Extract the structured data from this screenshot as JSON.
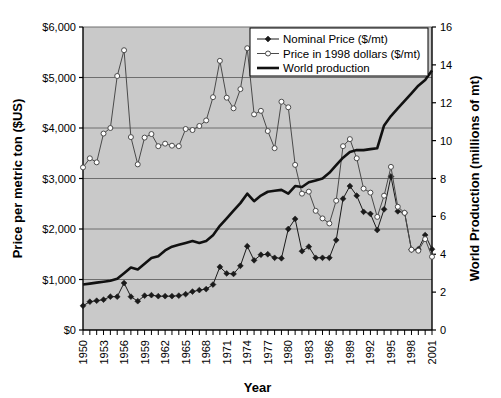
{
  "chart_data": {
    "type": "line",
    "title": "",
    "xlabel": "Year",
    "ylabel": "Price per metric ton ($US)",
    "y2label": "World Production (millions of mt)",
    "grid": true,
    "legend_position": "top-right",
    "plot_background": "#c9c9c9",
    "xlim": [
      1950,
      2001
    ],
    "ylim": [
      0,
      6000
    ],
    "y2lim": [
      0,
      16
    ],
    "ytick_labels": [
      "$0",
      "$1,000",
      "$2,000",
      "$3,000",
      "$4,000",
      "$5,000",
      "$6,000"
    ],
    "ytick_values": [
      0,
      1000,
      2000,
      3000,
      4000,
      5000,
      6000
    ],
    "y2tick_labels": [
      "0",
      "2",
      "4",
      "6",
      "8",
      "10",
      "12",
      "14",
      "16"
    ],
    "y2tick_values": [
      0,
      2,
      4,
      6,
      8,
      10,
      12,
      14,
      16
    ],
    "xtick_labels": [
      "1950",
      "1953",
      "1956",
      "1959",
      "1962",
      "1965",
      "1968",
      "1971",
      "1974",
      "1977",
      "1980",
      "1983",
      "1986",
      "1989",
      "1992",
      "1995",
      "1998",
      "2001"
    ],
    "xtick_values": [
      1950,
      1953,
      1956,
      1959,
      1962,
      1965,
      1968,
      1971,
      1974,
      1977,
      1980,
      1983,
      1986,
      1989,
      1992,
      1995,
      1998,
      2001
    ],
    "x": [
      1950,
      1951,
      1952,
      1953,
      1954,
      1955,
      1956,
      1957,
      1958,
      1959,
      1960,
      1961,
      1962,
      1963,
      1964,
      1965,
      1966,
      1967,
      1968,
      1969,
      1970,
      1971,
      1972,
      1973,
      1974,
      1975,
      1976,
      1977,
      1978,
      1979,
      1980,
      1981,
      1982,
      1983,
      1984,
      1985,
      1986,
      1987,
      1988,
      1989,
      1990,
      1991,
      1992,
      1993,
      1994,
      1995,
      1996,
      1997,
      1998,
      1999,
      2000,
      2001
    ],
    "series": [
      {
        "name": "Nominal Price ($/mt)",
        "axis": "left",
        "color": "#1a1a1a",
        "marker": "filled-diamond",
        "values": [
          480,
          560,
          580,
          600,
          660,
          660,
          930,
          660,
          570,
          680,
          690,
          670,
          670,
          670,
          680,
          710,
          760,
          790,
          810,
          900,
          1250,
          1120,
          1110,
          1270,
          1660,
          1380,
          1490,
          1500,
          1430,
          1420,
          2000,
          2200,
          1560,
          1650,
          1430,
          1430,
          1430,
          1780,
          2600,
          2850,
          2660,
          2340,
          2300,
          1980,
          2390,
          3040,
          2350,
          2320,
          1590,
          1600,
          1880,
          1600
        ]
      },
      {
        "name": "Price in 1998 dollars ($/mt)",
        "axis": "left",
        "color": "#4a4a4a",
        "marker": "open-circle",
        "values": [
          3220,
          3400,
          3320,
          3890,
          4000,
          5030,
          5540,
          3820,
          3280,
          3810,
          3880,
          3640,
          3690,
          3650,
          3640,
          3980,
          3960,
          4040,
          4150,
          4610,
          5330,
          4600,
          4390,
          4770,
          5580,
          4270,
          4340,
          3940,
          3600,
          4520,
          4410,
          3270,
          2700,
          2740,
          2360,
          2210,
          2110,
          2560,
          3640,
          3780,
          3400,
          2800,
          2720,
          2240,
          2660,
          3230,
          2440,
          2320,
          1590,
          1570,
          1800,
          1450
        ]
      },
      {
        "name": "World production",
        "axis": "right",
        "color": "#111111",
        "marker": "none",
        "values": [
          2.4,
          2.45,
          2.5,
          2.55,
          2.6,
          2.7,
          3.0,
          3.3,
          3.2,
          3.5,
          3.8,
          3.9,
          4.2,
          4.4,
          4.5,
          4.6,
          4.7,
          4.6,
          4.7,
          5.0,
          5.5,
          5.9,
          6.3,
          6.7,
          7.2,
          6.8,
          7.1,
          7.3,
          7.35,
          7.4,
          7.2,
          7.6,
          7.55,
          7.8,
          7.9,
          8.0,
          8.3,
          8.7,
          9.1,
          9.4,
          9.5,
          9.5,
          9.55,
          9.6,
          10.8,
          11.3,
          11.7,
          12.1,
          12.5,
          12.9,
          13.2,
          13.7
        ]
      }
    ]
  },
  "legend": {
    "items": [
      {
        "label": "Nominal Price ($/mt)",
        "marker": "filled-diamond"
      },
      {
        "label": "Price in 1998 dollars ($/mt)",
        "marker": "open-circle"
      },
      {
        "label": "World production",
        "marker": "solid-line"
      }
    ]
  }
}
